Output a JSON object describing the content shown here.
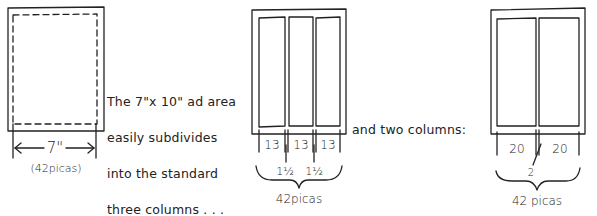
{
  "diagram": {
    "type": "ad-layout-grid-sketch",
    "ink_color": "#222222",
    "background": "#ffffff",
    "panels": [
      {
        "id": "ad-area",
        "label_width": "7\"",
        "label_picas": "(42picas)",
        "has_dashed_inner_border": true
      },
      {
        "id": "three-columns",
        "columns": 3,
        "column_widths": [
          "13",
          "13",
          "13"
        ],
        "gutters": [
          "1½",
          "1½"
        ],
        "total_label": "42picas"
      },
      {
        "id": "two-columns",
        "columns": 2,
        "column_widths": [
          "20",
          "20"
        ],
        "gutters": [
          "2"
        ],
        "total_label": "42 picas"
      }
    ],
    "captions": {
      "three_col_caption_lines": [
        "The 7\"x 10\" ad area",
        "easily subdivides",
        "into the standard",
        "three columns . . ."
      ],
      "two_col_caption": "and two columns:"
    }
  }
}
